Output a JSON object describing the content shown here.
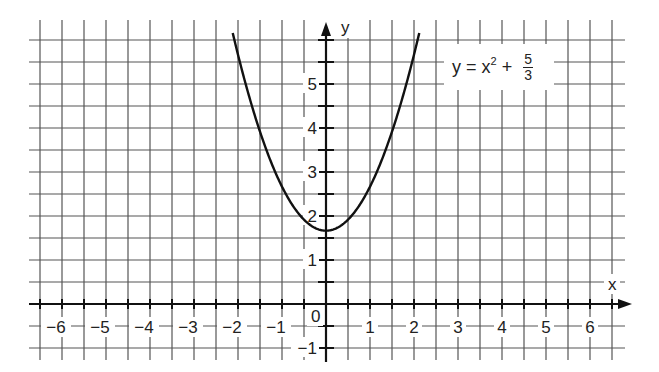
{
  "chart_data": {
    "type": "line",
    "title": "",
    "equation": "y = x^2 + 5/3",
    "xlabel": "x",
    "ylabel": "y",
    "xlim": [
      -6.5,
      6.5
    ],
    "ylim": [
      -1.3,
      6.2
    ],
    "x_ticks": [
      -6,
      -5,
      -4,
      -3,
      -2,
      -1,
      0,
      1,
      2,
      3,
      4,
      5,
      6
    ],
    "y_ticks": [
      -1,
      1,
      2,
      3,
      4,
      5
    ],
    "grid": true,
    "grid_step": 0.5,
    "series": [
      {
        "name": "y = x^2 + 5/3",
        "x": [
          -2.1,
          -2.0,
          -1.5,
          -1.0,
          -0.5,
          0,
          0.5,
          1.0,
          1.5,
          2.0,
          2.1
        ],
        "y": [
          6.08,
          5.67,
          3.92,
          2.67,
          1.92,
          1.67,
          1.92,
          2.67,
          3.92,
          5.67,
          6.08
        ]
      }
    ]
  },
  "labels": {
    "x_axis": "x",
    "y_axis": "y",
    "origin": "0",
    "eq_lhs": "y = x",
    "eq_exp": "2",
    "eq_plus": " + ",
    "eq_num": "5",
    "eq_den": "3"
  },
  "colors": {
    "grid": "#555555",
    "axis": "#111111",
    "curve": "#111111",
    "text": "#222222"
  }
}
